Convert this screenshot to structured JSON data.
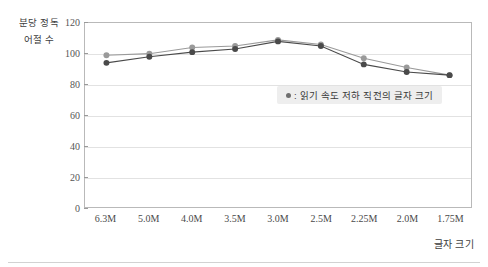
{
  "chart_data": {
    "type": "line",
    "title": "",
    "xlabel": "글자 크기",
    "ylabel": "분당 정독 어절 수",
    "ylabel_lines": [
      "분당 정독",
      "어절 수"
    ],
    "categories": [
      "6.3M",
      "5.0M",
      "4.0M",
      "3.5M",
      "3.0M",
      "2.5M",
      "2.25M",
      "2.0M",
      "1.75M"
    ],
    "ylim": [
      0,
      120
    ],
    "yticks": [
      0,
      20,
      40,
      60,
      80,
      100,
      120
    ],
    "grid": true,
    "legend_position": "inside-right",
    "series": [
      {
        "name": "읽기 속도 저하 직전의 글자 크기",
        "color": "#9a9a9a",
        "marker": "circle",
        "values": [
          99,
          100,
          104,
          105,
          109,
          106,
          97,
          91,
          86
        ]
      },
      {
        "name": "",
        "color": "#4a4a4a",
        "marker": "circle",
        "values": [
          94,
          98,
          101,
          103,
          108,
          105,
          93,
          88,
          86
        ]
      }
    ],
    "legend_entries": [
      {
        "marker_color": "#6f6f6f",
        "label": ": 읽기 속도 저하 직전의 글자 크기"
      }
    ]
  }
}
